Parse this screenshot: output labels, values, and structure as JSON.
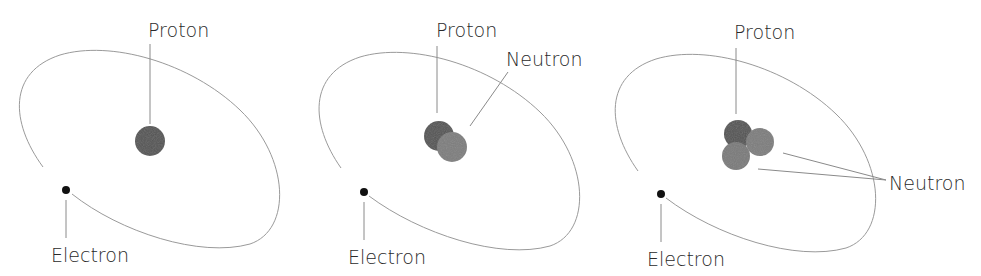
{
  "diagram": {
    "colors": {
      "proton": "#555555",
      "neutron": "#7e7e7e",
      "electron": "#111111",
      "orbit": "#9a9a9a",
      "text": "#2a2a2a"
    },
    "panels": [
      {
        "proton_label": "Proton",
        "electron_label": "Electron",
        "neutron_label": ""
      },
      {
        "proton_label": "Proton",
        "electron_label": "Electron",
        "neutron_label": "Neutron"
      },
      {
        "proton_label": "Proton",
        "electron_label": "Electron",
        "neutron_label": "Neutron"
      }
    ]
  }
}
